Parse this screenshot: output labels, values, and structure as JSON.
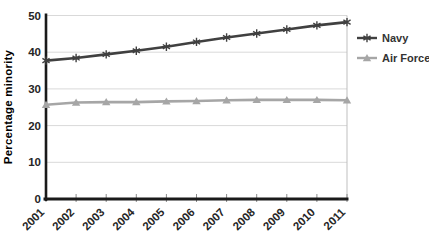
{
  "chart_data": {
    "type": "line",
    "title": "",
    "xlabel": "",
    "ylabel": "Percentage minority",
    "x": [
      "2001",
      "2002",
      "2003",
      "2004",
      "2005",
      "2006",
      "2007",
      "2008",
      "2009",
      "2010",
      "2011"
    ],
    "series": [
      {
        "name": "Navy",
        "marker": "asterisk",
        "color": "#404040",
        "values": [
          37.7,
          38.4,
          39.4,
          40.4,
          41.5,
          42.8,
          44.0,
          45.1,
          46.2,
          47.3,
          48.2
        ]
      },
      {
        "name": "Air Force",
        "marker": "triangle-up",
        "color": "#a6a6a6",
        "values": [
          25.7,
          26.3,
          26.4,
          26.4,
          26.6,
          26.7,
          26.9,
          27.0,
          27.0,
          27.0,
          26.9
        ]
      }
    ],
    "ylim": [
      0,
      50
    ],
    "yticks": [
      0,
      10,
      20,
      30,
      40,
      50
    ],
    "grid": true,
    "legend_position": "right"
  },
  "colors": {
    "grid": "#d9d9d9",
    "axis": "#1a1a1a",
    "plot_border": "#bfbfbf",
    "tick_mark": "#8c8c8c",
    "tick_text": "#262626",
    "axis_title_text": "#1a1a1a",
    "legend_text": "#333333",
    "background": "#ffffff"
  }
}
